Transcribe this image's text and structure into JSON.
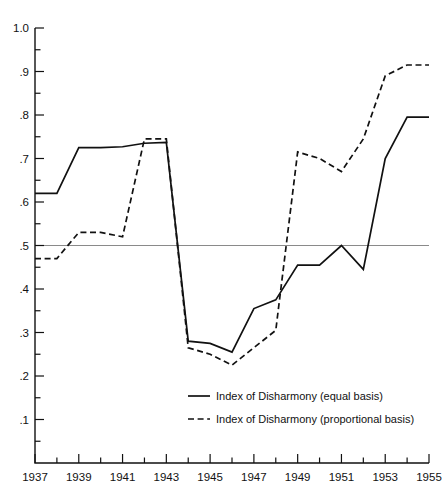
{
  "chart_data": {
    "type": "line",
    "title": "",
    "xlabel": "",
    "ylabel": "",
    "xlim": [
      1937,
      1955
    ],
    "ylim": [
      0.0,
      1.0
    ],
    "grid": false,
    "legend_position": "bottom-center",
    "reference_line": {
      "y": 0.5,
      "color": "#8a8a8a",
      "orientation": "horizontal"
    },
    "ytick_labels": [
      "1.0",
      ".9",
      ".8",
      ".7",
      ".6",
      ".5",
      ".4",
      ".3",
      ".2",
      ".1"
    ],
    "ytick_values": [
      1.0,
      0.9,
      0.8,
      0.7,
      0.6,
      0.5,
      0.4,
      0.3,
      0.2,
      0.1
    ],
    "yminor_values": [
      0.95,
      0.85,
      0.75,
      0.65,
      0.55,
      0.45,
      0.35,
      0.25,
      0.15,
      0.05
    ],
    "xtick_labels": [
      "1937",
      "1939",
      "1941",
      "1943",
      "1945",
      "1947",
      "1949",
      "1951",
      "1953",
      "1955"
    ],
    "xtick_values": [
      1937,
      1939,
      1941,
      1943,
      1945,
      1947,
      1949,
      1951,
      1953,
      1955
    ],
    "xminor_values": [
      1938,
      1940,
      1942,
      1944,
      1946,
      1948,
      1950,
      1952,
      1954
    ],
    "x": [
      1937,
      1938,
      1939,
      1940,
      1941,
      1942,
      1943,
      1944,
      1945,
      1946,
      1947,
      1948,
      1949,
      1950,
      1951,
      1952,
      1953,
      1954,
      1955
    ],
    "series": [
      {
        "name": "Index of Disharmony (equal basis)",
        "style": "solid",
        "color": "#111111",
        "values": [
          0.62,
          0.62,
          0.725,
          0.725,
          0.727,
          0.735,
          0.737,
          0.28,
          0.275,
          0.255,
          0.355,
          0.375,
          0.455,
          0.455,
          0.5,
          0.445,
          0.7,
          0.795,
          0.795
        ]
      },
      {
        "name": "Index of Disharmony (proportional basis)",
        "style": "dashed",
        "color": "#111111",
        "values": [
          0.47,
          0.47,
          0.53,
          0.53,
          0.52,
          0.745,
          0.745,
          0.265,
          0.25,
          0.225,
          0.265,
          0.305,
          0.715,
          0.7,
          0.67,
          0.745,
          0.89,
          0.915,
          0.915
        ]
      }
    ]
  },
  "legend": {
    "items": [
      {
        "label": "Index of Disharmony (equal basis)",
        "style": "solid"
      },
      {
        "label": "Index of Disharmony (proportional basis)",
        "style": "dashed"
      }
    ]
  }
}
